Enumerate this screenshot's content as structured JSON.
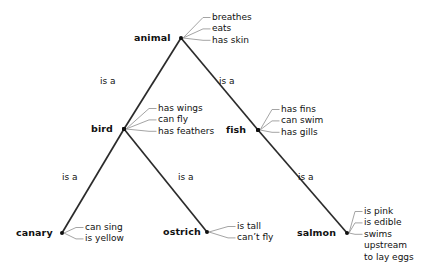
{
  "diagram": {
    "background_color": "#ffffff",
    "edge_color": "#2b2b2b",
    "property_line_color": "#9a9a9a",
    "text_color": "#111111",
    "relation_label": "is a",
    "nodes": [
      {
        "id": "animal",
        "label": "animal",
        "x": 181,
        "y": 38,
        "label_x": 134,
        "label_y": 33,
        "marker": "dot",
        "properties": [
          "breathes",
          "eats",
          "has skin"
        ],
        "prop_x": 212,
        "prop_y": 12
      },
      {
        "id": "bird",
        "label": "bird",
        "x": 124,
        "y": 129,
        "label_x": 91,
        "label_y": 124,
        "marker": "square",
        "properties": [
          "has wings",
          "can fly",
          "has feathers"
        ],
        "prop_x": 158,
        "prop_y": 103
      },
      {
        "id": "fish",
        "label": "fish",
        "x": 258,
        "y": 130,
        "label_x": 226,
        "label_y": 125,
        "marker": "square",
        "properties": [
          "has fins",
          "can swim",
          "has gills"
        ],
        "prop_x": 281,
        "prop_y": 104
      },
      {
        "id": "canary",
        "label": "canary",
        "x": 62,
        "y": 233,
        "label_x": 16,
        "label_y": 228,
        "marker": "dot",
        "properties": [
          "can sing",
          "is yellow"
        ],
        "prop_x": 85,
        "prop_y": 222
      },
      {
        "id": "ostrich",
        "label": "ostrich",
        "x": 207,
        "y": 232,
        "label_x": 163,
        "label_y": 227,
        "marker": "dot",
        "properties": [
          "is tall",
          "can’t fly"
        ],
        "prop_x": 237,
        "prop_y": 221
      },
      {
        "id": "salmon",
        "label": "salmon",
        "x": 347,
        "y": 233,
        "label_x": 297,
        "label_y": 228,
        "marker": "dot",
        "properties": [
          "is pink",
          "is edible",
          "swims",
          "upstream",
          "to lay eggs"
        ],
        "prop_x": 364,
        "prop_y": 206
      }
    ],
    "edges": [
      {
        "id": "animal-bird",
        "from": "animal",
        "to": "bird",
        "label": "is a",
        "label_x": 100,
        "label_y": 76
      },
      {
        "id": "animal-fish",
        "from": "animal",
        "to": "fish",
        "label": "is a",
        "label_x": 219,
        "label_y": 76
      },
      {
        "id": "bird-canary",
        "from": "bird",
        "to": "canary",
        "label": "is a",
        "label_x": 62,
        "label_y": 172
      },
      {
        "id": "bird-ostrich",
        "from": "bird",
        "to": "ostrich",
        "label": "is a",
        "label_x": 178,
        "label_y": 172
      },
      {
        "id": "fish-salmon",
        "from": "fish",
        "to": "salmon",
        "label": "is a",
        "label_x": 298,
        "label_y": 172
      }
    ]
  }
}
